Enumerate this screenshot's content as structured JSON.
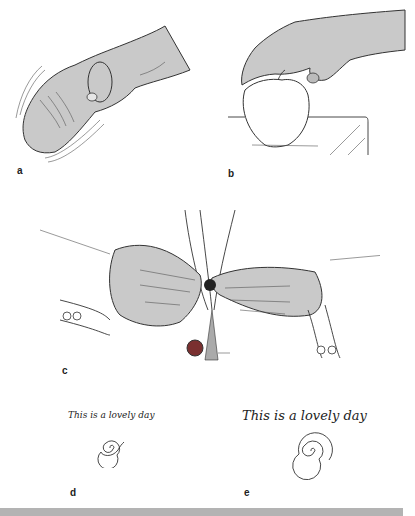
{
  "figure": {
    "panels": [
      {
        "id": "a",
        "label": "a",
        "description": "Resting hand tremor, hand with motion lines"
      },
      {
        "id": "b",
        "label": "b",
        "description": "Hand resting on an apple on a table edge"
      },
      {
        "id": "c",
        "label": "c",
        "description": "Two hands buttoning a shirt"
      },
      {
        "id": "d",
        "label": "d",
        "handwriting": "This is a lovely day",
        "spiral": "small spiral"
      },
      {
        "id": "e",
        "label": "e",
        "handwriting": "This is a lovely day",
        "spiral": "large spiral"
      }
    ]
  },
  "colors": {
    "skin": "#c9c9c9",
    "ink": "#333333",
    "bar": "#b3b3b3",
    "button": "#7a3030"
  }
}
